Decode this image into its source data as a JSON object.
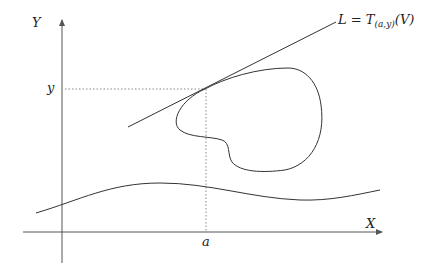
{
  "diagram": {
    "axes": {
      "x_label": "X",
      "y_label": "Y"
    },
    "point": {
      "x_label": "a",
      "y_label": "y"
    },
    "tangent_line": {
      "label_prefix": "L = T",
      "label_subscript": "(a,y)",
      "label_suffix": "(V)"
    },
    "colors": {
      "stroke": "#333333",
      "axis": "#555555",
      "dotted": "#888888",
      "background": "#ffffff"
    }
  }
}
